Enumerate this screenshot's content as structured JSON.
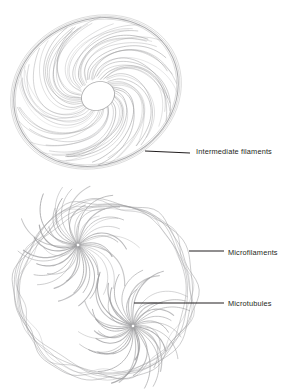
{
  "figure": {
    "background_color": "#ffffff",
    "filament_color": "#9a9a9c",
    "membrane_color": "#8e8e90",
    "leader_color": "#231f20",
    "text_color": "#231f20"
  },
  "cells": [
    {
      "name": "intermediate-filament-cell",
      "shape": "ellipse",
      "cx": 96,
      "cy": 92,
      "rx": 84,
      "ry": 72,
      "rotation": -24,
      "nucleus": {
        "cx": 98,
        "cy": 96,
        "rx": 17,
        "ry": 14
      },
      "filament_count": 64,
      "filament_style": "spiral-radial"
    },
    {
      "name": "microtubule-microfilament-cell",
      "shape": "circle",
      "cx": 105,
      "cy": 290,
      "r": 87,
      "cortex_strands": 7,
      "asters": [
        {
          "name": "aster-upper-left",
          "cx": 78,
          "cy": 245,
          "ray_count": 42,
          "ray_length": 58
        },
        {
          "name": "aster-lower-right",
          "cx": 133,
          "cy": 326,
          "ray_count": 42,
          "ray_length": 58
        }
      ]
    }
  ],
  "labels": [
    {
      "id": "intermediate-filaments",
      "text": "Intermediate filaments",
      "text_x": 196,
      "text_y": 148,
      "leader": {
        "x1": 145,
        "y1": 151,
        "x2": 190,
        "y2": 153
      }
    },
    {
      "id": "microfilaments",
      "text": "Microfilaments",
      "text_x": 228,
      "text_y": 249,
      "leader": {
        "x1": 189,
        "y1": 251,
        "x2": 224,
        "y2": 251
      }
    },
    {
      "id": "microtubules",
      "text": "Microtubules",
      "text_x": 228,
      "text_y": 300,
      "leader": {
        "x1": 134,
        "y1": 303,
        "x2": 224,
        "y2": 303
      }
    }
  ]
}
